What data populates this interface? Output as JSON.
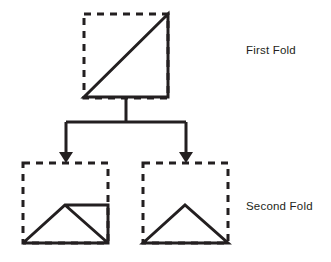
{
  "diagram": {
    "type": "flowchart",
    "canvas": {
      "width": 331,
      "height": 262
    },
    "colors": {
      "stroke": "#231f20",
      "background": "#ffffff",
      "text": "#231f20"
    },
    "labels": {
      "first_fold": "First Fold",
      "second_fold": "Second Fold"
    },
    "label_positions": {
      "first_fold": {
        "x": 246,
        "y": 51
      },
      "second_fold": {
        "x": 246,
        "y": 207
      }
    },
    "nodes": [
      {
        "id": "first-fold-node",
        "stage": "First Fold",
        "dashed_square": {
          "x": 84,
          "y": 14,
          "width": 84,
          "height": 84
        },
        "solid_path": "M 84 97 L 168 14 L 168 97 Z",
        "shape_description": "right triangle with hypotenuse from bottom-left to top-right"
      },
      {
        "id": "second-fold-left-node",
        "stage": "Second Fold",
        "dashed_square": {
          "x": 23,
          "y": 163,
          "width": 85,
          "height": 80
        },
        "solid_path": "M 23 243 L 65 205 L 108 205 L 108 243 L 23 243 M 65 205 L 108 243",
        "shape_description": "triangle with apex at center and attached right trapezoid flap"
      },
      {
        "id": "second-fold-right-node",
        "stage": "Second Fold",
        "dashed_square": {
          "x": 143,
          "y": 163,
          "width": 85,
          "height": 80
        },
        "solid_path": "M 143 243 L 185 205 L 228 243 Z",
        "shape_description": "isosceles triangle resting on the base"
      }
    ],
    "connectors": [
      {
        "id": "trunk",
        "path": "M 126 97 L 126 122 M 66 122 L 186 122 M 66 122 L 66 153 M 186 122 L 186 153",
        "description": "vertical stem from first fold splitting into two branches"
      }
    ],
    "arrows": [
      {
        "id": "arrow-to-left-node",
        "points": "59,152 73,152 66,163",
        "target": "second-fold-left-node"
      },
      {
        "id": "arrow-to-right-node",
        "points": "179,152 193,152 186,163",
        "target": "second-fold-right-node"
      }
    ]
  }
}
